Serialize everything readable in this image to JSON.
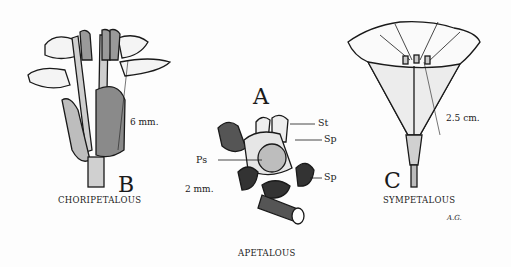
{
  "figures": [
    {
      "id": "B",
      "letter": "B",
      "caption": "CHORIPETALOUS",
      "scale": "6 mm."
    },
    {
      "id": "A",
      "letter": "A",
      "caption": "APETALOUS",
      "scale": "2 mm.",
      "parts": [
        "St",
        "Sp",
        "Ps",
        "Sp"
      ]
    },
    {
      "id": "C",
      "letter": "C",
      "caption": "SYMPETALOUS",
      "scale": "2.5 cm."
    }
  ],
  "signature": "A.G."
}
